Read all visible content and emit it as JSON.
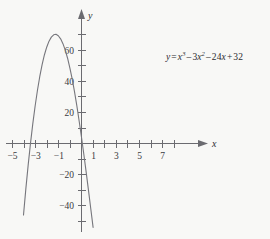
{
  "figure": {
    "background_color": "#f8f8f6",
    "curve_color": "#76767c",
    "axis_color": "#6b6b70",
    "equation_label": {
      "lhs": "y",
      "eq": "=",
      "term1_base": "x",
      "term1_exp": "3",
      "op1": "–",
      "term2_coef": "3",
      "term2_base": "x",
      "term2_exp": "2",
      "op2": "–",
      "term3_coef": "24",
      "term3_base": "x",
      "op3": "+",
      "term4": "32",
      "plain": "y = x3 – 3x2 – 24x + 32"
    },
    "axis_names": {
      "x": "x",
      "y": "y"
    }
  },
  "chart_data": {
    "type": "line",
    "title": "",
    "subtitle": "",
    "xlabel": "x",
    "ylabel": "y",
    "xlim": [
      -5.8,
      7.8
    ],
    "ylim": [
      -58,
      72
    ],
    "grid": false,
    "legend": "none",
    "annotations": [
      {
        "text": "y = x³ – 3x² – 24x + 32",
        "x": 3.2,
        "y": 52
      }
    ],
    "x_ticks_major": [
      -5,
      -3,
      -1,
      1,
      3,
      5,
      7
    ],
    "x_tick_labels": [
      "−5",
      "−3",
      "−1",
      "1",
      "3",
      "5",
      "7"
    ],
    "x_ticks_all": [
      -5,
      -4,
      -3,
      -2,
      -1,
      1,
      2,
      3,
      4,
      5,
      6,
      7
    ],
    "y_ticks_major": [
      -40,
      -20,
      20,
      40,
      60
    ],
    "y_tick_labels": [
      "−40",
      "−20",
      "20",
      "40",
      "60"
    ],
    "y_ticks_all": [
      -50,
      -40,
      -30,
      -20,
      -10,
      10,
      20,
      30,
      40,
      50,
      60,
      70
    ],
    "series": [
      {
        "name": "y = x^3 - 3x^2 - 24x + 32",
        "expression": "x^3 - 3*x^2 - 24*x + 32",
        "x": [
          -5.4,
          -5.2,
          -5.0,
          -4.8,
          -4.6,
          -4.4,
          -4.2,
          -4.0,
          -3.8,
          -3.6,
          -3.4,
          -3.2,
          -3.0,
          -2.8,
          -2.6,
          -2.4,
          -2.2,
          -2.0,
          -1.8,
          -1.6,
          -1.4,
          -1.2,
          -1.0,
          -0.8,
          -0.6,
          -0.4,
          -0.2,
          0.0,
          0.2,
          0.4,
          0.6,
          0.8,
          1.0,
          1.2,
          1.4,
          1.6,
          1.8,
          2.0,
          2.2,
          2.4,
          2.6,
          2.8,
          3.0,
          3.2,
          3.4,
          3.6,
          3.8,
          4.0,
          4.2,
          4.4,
          4.6,
          4.8,
          5.0,
          5.2,
          5.4,
          5.6,
          5.8,
          6.0,
          6.2,
          6.4,
          6.6,
          6.8,
          7.0
        ],
        "y": [
          -83.1,
          -63.9,
          -46.0,
          -29.4,
          -14.1,
          -0.1,
          12.6,
          24.0,
          34.1,
          43.0,
          50.6,
          57.0,
          62.0,
          65.9,
          68.5,
          70.0,
          70.3,
          69.4,
          67.4,
          64.3,
          60.1,
          54.9,
          48.6,
          41.4,
          33.3,
          24.2,
          14.3,
          4.0,
          -6.9,
          -18.3,
          -30.0,
          -42.0,
          -54.0,
          -66.0,
          -77.9,
          -89.8,
          -101.5,
          -113.0,
          -124.3,
          -135.4,
          -146.2,
          -156.7,
          -166.9,
          -176.7,
          -186.1,
          -195.1,
          -203.6,
          -211.7,
          -219.2,
          -226.2,
          -232.6,
          -238.4,
          -243.5,
          -248.0,
          -251.8,
          -254.9,
          -257.2,
          -258.8,
          -259.5,
          -259.4,
          -258.4,
          -256.6,
          -253.9
        ],
        "key_points": {
          "roots": [
            -4.79,
            1.19,
            5.6
          ],
          "local_max": {
            "x": -2.0,
            "y": 60.0
          },
          "local_min": {
            "x": 4.0,
            "y": -48.0
          },
          "y_intercept": {
            "x": 0,
            "y": 32
          }
        }
      }
    ]
  }
}
